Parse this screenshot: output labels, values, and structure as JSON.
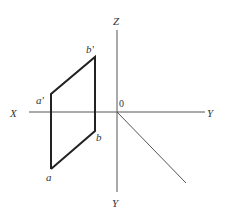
{
  "diagram": {
    "type": "orthographic-projection-axes",
    "axes": {
      "x_label": "X",
      "y_right_label": "Y",
      "z_label": "Z",
      "y_bottom_label": "Y",
      "origin_label": "0"
    },
    "points": {
      "a_prime": "a'",
      "b_prime": "b'",
      "a": "a",
      "b": "b"
    },
    "colors": {
      "axis": "#555555",
      "shape": "#222222",
      "background": "#ffffff"
    }
  }
}
